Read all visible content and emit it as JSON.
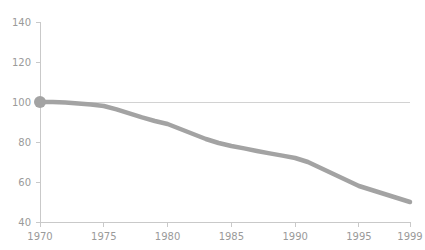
{
  "chart_data": {
    "type": "line",
    "title": "",
    "subtitle": "",
    "xlabel": "",
    "ylabel": "",
    "x": [
      1970,
      1971,
      1972,
      1973,
      1974,
      1975,
      1976,
      1977,
      1978,
      1979,
      1980,
      1981,
      1982,
      1983,
      1984,
      1985,
      1986,
      1987,
      1988,
      1989,
      1990,
      1991,
      1992,
      1993,
      1994,
      1995,
      1996,
      1997,
      1998,
      1999
    ],
    "series": [
      {
        "name": "index",
        "values": [
          100,
          100,
          99.7,
          99.3,
          98.8,
          98.0,
          96.3,
          94.3,
          92.3,
          90.5,
          89.0,
          86.5,
          84.0,
          81.5,
          79.5,
          78.0,
          76.8,
          75.5,
          74.3,
          73.2,
          72.0,
          70.0,
          67.0,
          64.0,
          61.0,
          58.0,
          56.0,
          54.0,
          52.0,
          50.0
        ]
      }
    ],
    "xlim": [
      1970,
      1999
    ],
    "ylim": [
      40,
      140
    ],
    "x_ticks": [
      1970,
      1975,
      1980,
      1985,
      1990,
      1995,
      1999
    ],
    "x_tick_labels": [
      "1970",
      "1975",
      "1980",
      "1985",
      "1990",
      "1995",
      "1999"
    ],
    "y_ticks": [
      40,
      60,
      80,
      100,
      120,
      140
    ],
    "y_tick_labels": [
      "40",
      "60",
      "80",
      "100",
      "120",
      "140"
    ],
    "grid": false,
    "legend": null,
    "legend_position": "none",
    "reference_lines": [
      {
        "name": "baseline-100",
        "axis": "y",
        "value": 100,
        "color": "#d2d2d2"
      }
    ],
    "markers": [
      {
        "name": "start-point",
        "x": 1970,
        "y": 100,
        "color": "#a3a3a3",
        "radius": 6
      }
    ],
    "colors": {
      "line": "#a3a3a3",
      "marker": "#a3a3a3",
      "axis": "#c9c9c9",
      "tick_label": "#9a9a9a",
      "reference_line": "#d2d2d2",
      "background": "#ffffff"
    }
  }
}
